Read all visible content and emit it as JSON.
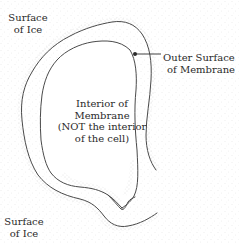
{
  "diagram": {
    "labels": {
      "surface_of_ice_top": [
        "Surface",
        "of Ice"
      ],
      "surface_of_ice_bottom": [
        "Surface",
        "of Ice"
      ],
      "outer_surface": [
        "Outer Surface",
        "of Membrane"
      ],
      "interior": [
        "Interior of",
        "Membrane",
        "(NOT the interior",
        "of the cell)"
      ]
    },
    "colors": {
      "line": "#4a4a4a",
      "stipple": "#9a9a9a",
      "text": "#2a2a2a",
      "background": "#ffffff"
    }
  }
}
